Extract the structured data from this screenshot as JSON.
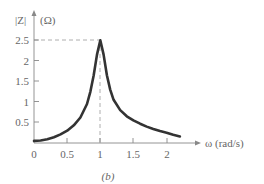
{
  "chart_data": {
    "type": "line",
    "title": "",
    "caption": "(b)",
    "xlabel": "ω (rad/s)",
    "ylabel": "|Z| (Ω)",
    "ylabel_parts": [
      "|Z|",
      "(Ω)"
    ],
    "xlim": [
      0,
      2.3
    ],
    "ylim": [
      0,
      2.7
    ],
    "x_ticks": [
      0,
      0.5,
      1,
      1.5,
      2
    ],
    "x_tick_labels": [
      "0",
      "0.5",
      "1",
      "1.5",
      "2"
    ],
    "y_ticks": [
      0.5,
      1,
      1.5,
      2,
      2.5
    ],
    "y_tick_labels": [
      "0.5",
      "1",
      "1.5",
      "2",
      "2.5"
    ],
    "grid": false,
    "legend": null,
    "annotations": [
      {
        "type": "dashed-line",
        "description": "horizontal from y-axis to peak",
        "x": [
          0,
          1
        ],
        "y": [
          2.5,
          2.5
        ]
      },
      {
        "type": "dashed-line",
        "description": "vertical from peak to x-axis",
        "x": [
          1,
          1
        ],
        "y": [
          0,
          2.5
        ]
      }
    ],
    "series": [
      {
        "name": "|Z|",
        "color": "#333333",
        "x": [
          0,
          0.1,
          0.2,
          0.3,
          0.4,
          0.5,
          0.6,
          0.7,
          0.8,
          0.85,
          0.9,
          0.95,
          1.0,
          1.05,
          1.1,
          1.15,
          1.2,
          1.3,
          1.4,
          1.5,
          1.6,
          1.7,
          1.8,
          1.9,
          2.0,
          2.1,
          2.2
        ],
        "values": [
          0.05,
          0.06,
          0.09,
          0.14,
          0.21,
          0.3,
          0.43,
          0.62,
          0.95,
          1.25,
          1.65,
          2.15,
          2.5,
          2.15,
          1.65,
          1.3,
          1.05,
          0.8,
          0.65,
          0.55,
          0.47,
          0.4,
          0.34,
          0.29,
          0.25,
          0.2,
          0.16
        ]
      }
    ]
  },
  "colors": {
    "curve": "#333333",
    "axis": "#888888",
    "dashed": "#999999",
    "text": "#666666"
  },
  "labels": {
    "y_axis_title_main": "|Z|",
    "y_axis_title_unit": "(Ω)",
    "x_axis_title": "ω (rad/s)",
    "caption": "(b)",
    "x_ticks": [
      "0",
      "0.5",
      "1",
      "1.5",
      "2"
    ],
    "y_ticks": [
      "0.5",
      "1",
      "1.5",
      "2",
      "2.5"
    ]
  }
}
